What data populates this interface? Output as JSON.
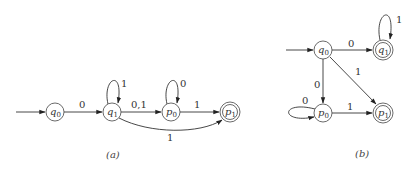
{
  "diagram_a": {
    "caption": "(a)",
    "states": [
      {
        "id": "q0",
        "base": "q",
        "sub": "0",
        "accepting": false,
        "start": true
      },
      {
        "id": "q1",
        "base": "q",
        "sub": "1",
        "accepting": false,
        "start": false
      },
      {
        "id": "p0",
        "base": "p",
        "sub": "0",
        "accepting": false,
        "start": false
      },
      {
        "id": "p1",
        "base": "p",
        "sub": "1",
        "accepting": true,
        "start": false
      }
    ],
    "transitions": [
      {
        "from": "q0",
        "to": "q1",
        "label": "0"
      },
      {
        "from": "q1",
        "to": "q1",
        "label": "1"
      },
      {
        "from": "q1",
        "to": "p0",
        "label": "0,1"
      },
      {
        "from": "p0",
        "to": "p0",
        "label": "0"
      },
      {
        "from": "p0",
        "to": "p1",
        "label": "1"
      },
      {
        "from": "q1",
        "to": "p1",
        "label": "1"
      }
    ]
  },
  "diagram_b": {
    "caption": "(b)",
    "states": [
      {
        "id": "q0",
        "base": "q",
        "sub": "0",
        "accepting": false,
        "start": true
      },
      {
        "id": "q1",
        "base": "q",
        "sub": "1",
        "accepting": true,
        "start": false
      },
      {
        "id": "p0",
        "base": "p",
        "sub": "0",
        "accepting": false,
        "start": false
      },
      {
        "id": "p1",
        "base": "p",
        "sub": "1",
        "accepting": true,
        "start": false
      }
    ],
    "transitions": [
      {
        "from": "q0",
        "to": "q1",
        "label": "0"
      },
      {
        "from": "q1",
        "to": "q1",
        "label": "1"
      },
      {
        "from": "q0",
        "to": "p0",
        "label": "0"
      },
      {
        "from": "q0",
        "to": "p1",
        "label": "1"
      },
      {
        "from": "p0",
        "to": "p0",
        "label": "0"
      },
      {
        "from": "p0",
        "to": "p1",
        "label": "1"
      }
    ]
  }
}
